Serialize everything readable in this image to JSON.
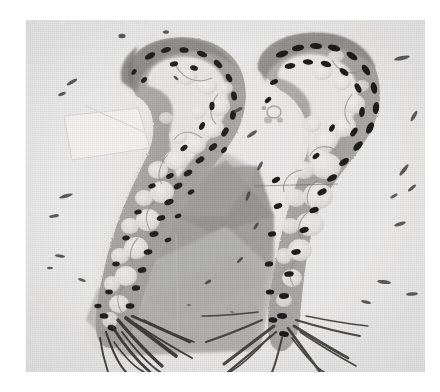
{
  "figure": {
    "kind": "light-micrograph",
    "modality": "histology-section",
    "stain_appearance": "grayscale / monochrome halftone print",
    "panel_count": 2,
    "caption": "",
    "background_tone": "#ececeb",
    "plate": {
      "left": 26,
      "top": 20,
      "width": 399,
      "height": 352,
      "border": "none",
      "margin_color": "#ffffff"
    },
    "palette": {
      "page_white": "#ffffff",
      "plate_background": "#ececeb",
      "slide_pale": "#f2f1ef",
      "cytoplasm_mid_gray": "#a8a6a2",
      "cytoplasm_light_gray": "#c6c4c0",
      "vacuole_pale": "#e8e7e4",
      "nucleus_black": "#171717",
      "nucleus_dark": "#2a2a2a",
      "fiber_dark": "#333331",
      "wedge_dark_gray": "#9b9a96",
      "wedge_light_gray": "#b9b8b4",
      "artifact_pale_quad": "#f5f4f2"
    },
    "artifacts": [
      {
        "name": "dark-gray-wedge",
        "description": "large angular gray quadrilateral behind left specimen, lower-right diagonal edge",
        "tone": "#9b9a96"
      },
      {
        "name": "light-gray-wedge",
        "description": "second paler triangular gray field below and left of the dark wedge",
        "tone": "#b9b8b4"
      },
      {
        "name": "pale-quadrilateral",
        "description": "faint lighter rectangle with thin outline in upper-left background",
        "tone": "#f5f4f2"
      }
    ],
    "panels": [
      {
        "id": "panel-left",
        "label": "",
        "position": "left",
        "specimen": "hook-shaped tissue section (question-mark / S-curved profile)",
        "features": [
          "curved hook at top opening to the left",
          "elongated descending limb toward lower-left",
          "row of dark elliptical nuclei along the outer margin",
          "pale rounded vacuolated cells filling the interior",
          "fan of dark fiber strands at the basal end"
        ],
        "nuclei_count_visible": 46,
        "vacuoles_count_visible": 24,
        "fibers_count_visible": 12
      },
      {
        "id": "panel-right",
        "label": "",
        "position": "right",
        "specimen": "hook-shaped tissue section (question-mark / S-curved profile)",
        "features": [
          "curved hook at top opening to the left",
          "dense row of slanted black nuclei along the upper arc",
          "large pale vacuoles in mid-section bounded by thin gray septa",
          "narrow descending stalk",
          "radiating fibers at the basal end"
        ],
        "nuclei_count_visible": 38,
        "vacuoles_count_visible": 18,
        "fibers_count_visible": 16
      }
    ]
  }
}
